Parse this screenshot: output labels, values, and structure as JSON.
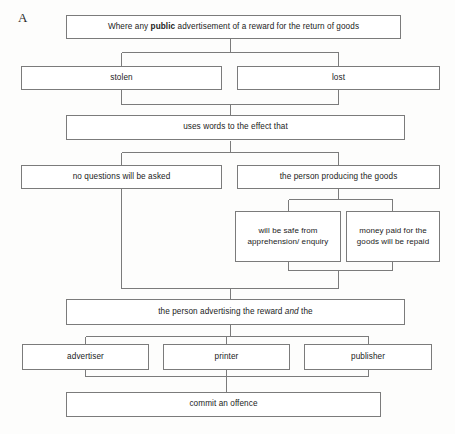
{
  "diagram": {
    "label": "A",
    "line_color": "#7b7b7b",
    "box_fill": "#ffffff",
    "text_color": "#1b1b1b",
    "nodes": {
      "root": {
        "text_before": "Where any ",
        "emphasis": "public",
        "text_after": " advertisement of a reward for the return of goods"
      },
      "stolen": "stolen",
      "lost": "lost",
      "uses_words": "uses words to the effect that",
      "no_questions": "no questions will be asked",
      "person_producing": "the person producing the goods",
      "safe_from": "will be safe from apprehension/ enquiry",
      "money_repaid": "money paid for the goods will be repaid",
      "person_advertising_before": "the person advertising the reward ",
      "person_advertising_emphasis": "and",
      "person_advertising_after": " the",
      "advertiser": "advertiser",
      "printer": "printer",
      "publisher": "publisher",
      "offence": "commit an offence"
    }
  }
}
